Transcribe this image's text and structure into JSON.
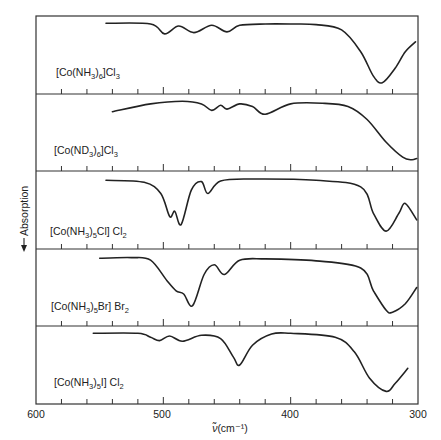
{
  "chart_data": {
    "type": "line",
    "title": "",
    "xlabel": "ν̃ (cm⁻¹)",
    "ylabel": "Absorption",
    "ylabel_arrow": "down",
    "xlim": [
      600,
      300
    ],
    "x_ticks": [
      600,
      500,
      400,
      300
    ],
    "x_minor_step": 20,
    "grid": false,
    "legend": "none",
    "layout": "stacked panels (5), shared x-axis",
    "panels": [
      {
        "label": "[Co(NH3)6]Cl3",
        "label_parts": [
          "[Co(NH",
          "3",
          ")",
          "6",
          "]Cl",
          "3"
        ],
        "x_start": 545,
        "bands_cm-1": [
          499,
          476,
          450
        ],
        "strong_band_cm-1": 328,
        "series": {
          "x": [
            545,
            510,
            499,
            488,
            476,
            462,
            450,
            440,
            420,
            400,
            380,
            360,
            345,
            335,
            328,
            318,
            310,
            302
          ],
          "absorption_rel": [
            0.02,
            0.03,
            0.18,
            0.06,
            0.16,
            0.05,
            0.15,
            0.05,
            0.03,
            0.03,
            0.04,
            0.12,
            0.45,
            0.82,
            0.92,
            0.7,
            0.45,
            0.3
          ]
        }
      },
      {
        "label": "[Co(ND3)6]Cl3",
        "label_parts": [
          "[Co(ND",
          "3",
          ")",
          "6",
          "]Cl",
          "3"
        ],
        "x_start": 540,
        "bands_cm-1": [
          462,
          450,
          420
        ],
        "strong_band_cm-1": 305,
        "series": {
          "x": [
            540,
            510,
            485,
            470,
            462,
            455,
            450,
            440,
            430,
            420,
            400,
            375,
            355,
            340,
            325,
            312,
            305,
            301
          ],
          "absorption_rel": [
            0.18,
            0.06,
            0.02,
            0.06,
            0.16,
            0.08,
            0.14,
            0.06,
            0.1,
            0.22,
            0.06,
            0.05,
            0.1,
            0.3,
            0.65,
            0.88,
            0.92,
            0.9
          ]
        }
      },
      {
        "label": "[Co(NH3)5Cl]Cl2",
        "label_parts": [
          "[Co(NH",
          "3",
          ")",
          "5",
          "Cl] Cl",
          "2"
        ],
        "x_start": 545,
        "bands_cm-1": [
          495,
          486,
          465
        ],
        "strong_band_cm-1": 325,
        "series": {
          "x": [
            545,
            515,
            502,
            495,
            491,
            486,
            478,
            470,
            465,
            455,
            430,
            380,
            345,
            335,
            325,
            315,
            310,
            301
          ],
          "absorption_rel": [
            0.05,
            0.08,
            0.25,
            0.6,
            0.52,
            0.72,
            0.2,
            0.07,
            0.25,
            0.06,
            0.03,
            0.05,
            0.15,
            0.55,
            0.82,
            0.55,
            0.4,
            0.65
          ]
        }
      },
      {
        "label": "[Co(NH3)5Br]Br2",
        "label_parts": [
          "[Co(NH",
          "3",
          ")",
          "5",
          "Br] Br",
          "2"
        ],
        "x_start": 550,
        "bands_cm-1": [
          490,
          477,
          452
        ],
        "strong_band_cm-1": 320,
        "series": {
          "x": [
            550,
            525,
            510,
            497,
            490,
            484,
            477,
            468,
            460,
            452,
            440,
            420,
            380,
            345,
            335,
            325,
            320,
            310,
            301
          ],
          "absorption_rel": [
            0.05,
            0.04,
            0.08,
            0.4,
            0.55,
            0.6,
            0.78,
            0.3,
            0.15,
            0.3,
            0.08,
            0.06,
            0.09,
            0.2,
            0.55,
            0.85,
            0.88,
            0.75,
            0.5
          ]
        }
      },
      {
        "label": "[Co(NH3)5I]Cl2",
        "label_parts": [
          "[Co(NH",
          "3",
          ")",
          "5",
          "I] Cl",
          "2"
        ],
        "x_start": 555,
        "bands_cm-1": [
          503,
          485,
          440
        ],
        "strong_band_cm-1": 325,
        "series": {
          "x": [
            555,
            520,
            510,
            503,
            495,
            485,
            470,
            455,
            445,
            440,
            430,
            415,
            400,
            365,
            350,
            338,
            325,
            318,
            308
          ],
          "absorption_rel": [
            0.02,
            0.02,
            0.08,
            0.13,
            0.06,
            0.14,
            0.05,
            0.1,
            0.38,
            0.5,
            0.2,
            0.03,
            0.02,
            0.08,
            0.3,
            0.7,
            0.9,
            0.78,
            0.55
          ]
        }
      }
    ]
  },
  "axis": {
    "x_tick_labels": [
      "600",
      "500",
      "400",
      "300"
    ],
    "x_title_symbol": "ν̃",
    "x_title_unit": "(cm⁻¹)",
    "y_title": "Absorption"
  }
}
